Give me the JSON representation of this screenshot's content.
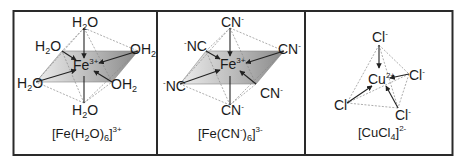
{
  "figure": {
    "panels": [
      {
        "id": "fe-h2o6",
        "center_ion": {
          "symbol": "Fe",
          "charge": "3+"
        },
        "ligands": [
          {
            "pos": "top",
            "text": "H",
            "sub": "2",
            "tail": "O"
          },
          {
            "pos": "upper-left",
            "text": "H",
            "sub": "2",
            "tail": "O"
          },
          {
            "pos": "upper-right",
            "text": "OH",
            "sub": "2",
            "tail": ""
          },
          {
            "pos": "left",
            "text": "H",
            "sub": "2",
            "tail": "O"
          },
          {
            "pos": "lower-right",
            "text": "OH",
            "sub": "2",
            "tail": ""
          },
          {
            "pos": "bottom",
            "text": "H",
            "sub": "2",
            "tail": "O"
          }
        ],
        "geometry": "octahedral",
        "caption": {
          "pre": "[Fe(H",
          "sub1": "2",
          "mid": "O)",
          "sub2": "6",
          "post": "]",
          "sup": "3+"
        }
      },
      {
        "id": "fe-cn6",
        "center_ion": {
          "symbol": "Fe",
          "charge": "3+"
        },
        "ligands": [
          {
            "pos": "top",
            "text": "CN",
            "sup": "-"
          },
          {
            "pos": "upper-left",
            "pre_sup": "-",
            "text": "NC"
          },
          {
            "pos": "upper-right",
            "text": "CN",
            "sup": "-"
          },
          {
            "pos": "left",
            "pre_sup": "-",
            "text": "NC"
          },
          {
            "pos": "lower-right",
            "text": "CN",
            "sup": "-"
          },
          {
            "pos": "bottom",
            "text": "CN",
            "sup": "-"
          }
        ],
        "geometry": "octahedral",
        "caption": {
          "pre": "[Fe(CN",
          "sup1": "-",
          "mid": ")",
          "sub": "6",
          "post": "]",
          "sup": "3-"
        }
      },
      {
        "id": "cucl4",
        "center_ion": {
          "symbol": "Cu",
          "charge": "2+"
        },
        "ligands": [
          {
            "pos": "top",
            "text": "Cl",
            "sup": "-"
          },
          {
            "pos": "right",
            "text": "Cl",
            "sup": "-"
          },
          {
            "pos": "left",
            "text": "Cl",
            "sup": "-"
          },
          {
            "pos": "bottom",
            "text": "Cl",
            "sup": "-"
          }
        ],
        "geometry": "tetrahedral",
        "caption": {
          "pre": "[CuCl",
          "sub": "4",
          "post": "]",
          "sup": "2-"
        }
      }
    ],
    "colors": {
      "border": "#2a2a2a",
      "line": "#222222",
      "dashed": "#8a8a8a",
      "plane_light": "#e6e6e6",
      "plane_dark": "#8c8c8c"
    }
  }
}
